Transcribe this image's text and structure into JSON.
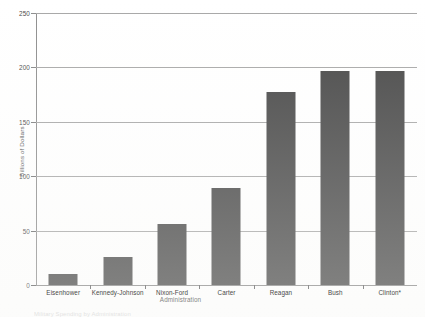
{
  "chart_data": {
    "type": "bar",
    "title": "",
    "subtitle": "",
    "categories": [
      "Eisenhower",
      "Kennedy-Johnson",
      "Nixon-Ford",
      "Carter",
      "Reagan",
      "Bush",
      "Clinton*"
    ],
    "values": [
      10,
      26,
      56,
      89,
      177,
      197,
      197
    ],
    "xlabel": "Administration",
    "ylabel": "Billions of Dollars",
    "ylim": [
      0,
      250
    ],
    "yticks": [
      0,
      50,
      100,
      150,
      200,
      250
    ],
    "ytick_labels": [
      "0",
      "50",
      "100",
      "150",
      "200",
      "250"
    ],
    "grid": true,
    "legend": false,
    "legend_position": "none",
    "series": [
      {
        "name": "Billions of Dollars",
        "values": [
          10,
          26,
          56,
          89,
          177,
          197,
          197
        ]
      }
    ],
    "bar_color": "#4a4a4a",
    "gridline_color": "#a8a8a8",
    "axis_color": "#8f8f8f",
    "background_color": "#ffffff"
  },
  "annotations": {
    "footnote": "Military Spending by Administration"
  }
}
